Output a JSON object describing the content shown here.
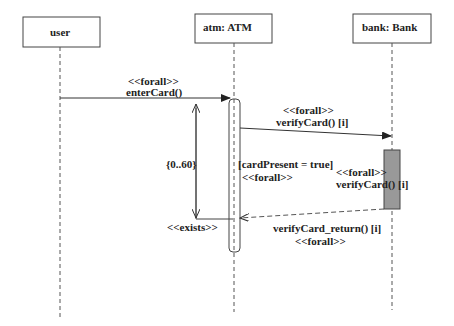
{
  "diagram": {
    "type": "sequence",
    "lifelines": [
      {
        "id": "user",
        "label": "user"
      },
      {
        "id": "atm",
        "label": "atm: ATM"
      },
      {
        "id": "bank",
        "label": "bank: Bank"
      }
    ],
    "messages": [
      {
        "stereotype": "<<forall>>",
        "label": "enterCard()",
        "from": "user",
        "to": "atm",
        "kind": "sync"
      },
      {
        "stereotype": "<<forall>>",
        "label": "verifyCard() [i]",
        "from": "atm",
        "to": "bank",
        "kind": "sync"
      },
      {
        "label": "verifyCard_return() [i]",
        "stereotype": "<<forall>>",
        "from": "bank",
        "to": "atm",
        "kind": "return"
      }
    ],
    "activation_label": {
      "stereotype": "<<forall>>",
      "label": "verifyCard() [i]"
    },
    "constraint": {
      "label": "[cardPresent = true]",
      "stereotype": "<<forall>>"
    },
    "timing": {
      "label": "{0..60}",
      "stereotype": "<<exists>>"
    }
  }
}
